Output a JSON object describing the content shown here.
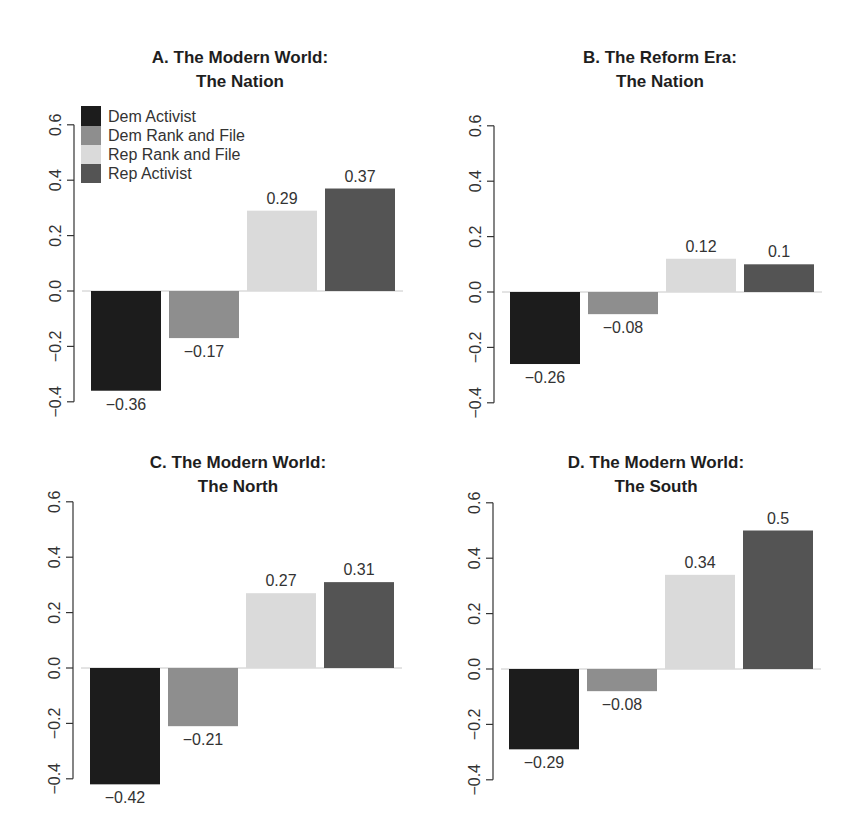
{
  "figure": {
    "colors": {
      "Dem Activist": "#1c1c1c",
      "Dem Rank and File": "#8e8e8e",
      "Rep Rank and File": "#dadada",
      "Rep Activist": "#545454"
    }
  },
  "legend": {
    "panel": "A",
    "entries": [
      {
        "label": "Dem Activist",
        "color": "#1c1c1c"
      },
      {
        "label": "Dem Rank and File",
        "color": "#8e8e8e"
      },
      {
        "label": "Rep Rank and File",
        "color": "#dadada"
      },
      {
        "label": "Rep Activist",
        "color": "#545454"
      }
    ]
  },
  "chart_data": [
    {
      "type": "bar",
      "panel": "A",
      "title": "A. The Modern World:",
      "subtitle": "The Nation",
      "categories": [
        "Dem Activist",
        "Dem Rank and File",
        "Rep Rank and File",
        "Rep Activist"
      ],
      "values": [
        -0.36,
        -0.17,
        0.29,
        0.37
      ],
      "value_labels": [
        "−0.36",
        "−0.17",
        "0.29",
        "0.37"
      ],
      "xlabel": "",
      "ylabel": "",
      "ylim": [
        -0.4,
        0.6
      ],
      "yticks": [
        "−0.4",
        "−0.2",
        "0.0",
        "0.2",
        "0.4",
        "0.6"
      ],
      "grid": false,
      "legend_position": "top-left"
    },
    {
      "type": "bar",
      "panel": "B",
      "title": "B. The Reform Era:",
      "subtitle": "The Nation",
      "categories": [
        "Dem Activist",
        "Dem Rank and File",
        "Rep Rank and File",
        "Rep Activist"
      ],
      "values": [
        -0.26,
        -0.08,
        0.12,
        0.1
      ],
      "value_labels": [
        "−0.26",
        "−0.08",
        "0.12",
        "0.1"
      ],
      "xlabel": "",
      "ylabel": "",
      "ylim": [
        -0.4,
        0.6
      ],
      "yticks": [
        "−0.4",
        "−0.2",
        "0.0",
        "0.2",
        "0.4",
        "0.6"
      ],
      "grid": false
    },
    {
      "type": "bar",
      "panel": "C",
      "title": "C. The Modern World:",
      "subtitle": "The North",
      "categories": [
        "Dem Activist",
        "Dem Rank and File",
        "Rep Rank and File",
        "Rep Activist"
      ],
      "values": [
        -0.42,
        -0.21,
        0.27,
        0.31
      ],
      "value_labels": [
        "−0.42",
        "−0.21",
        "0.27",
        "0.31"
      ],
      "xlabel": "",
      "ylabel": "",
      "ylim": [
        -0.4,
        0.6
      ],
      "yticks": [
        "−0.4",
        "−0.2",
        "0.0",
        "0.2",
        "0.4",
        "0.6"
      ],
      "grid": false
    },
    {
      "type": "bar",
      "panel": "D",
      "title": "D. The Modern World:",
      "subtitle": "The South",
      "categories": [
        "Dem Activist",
        "Dem Rank and File",
        "Rep Rank and File",
        "Rep Activist"
      ],
      "values": [
        -0.29,
        -0.08,
        0.34,
        0.5
      ],
      "value_labels": [
        "−0.29",
        "−0.08",
        "0.34",
        "0.5"
      ],
      "xlabel": "",
      "ylabel": "",
      "ylim": [
        -0.4,
        0.6
      ],
      "yticks": [
        "−0.4",
        "−0.2",
        "0.0",
        "0.2",
        "0.4",
        "0.6"
      ],
      "grid": false
    }
  ]
}
